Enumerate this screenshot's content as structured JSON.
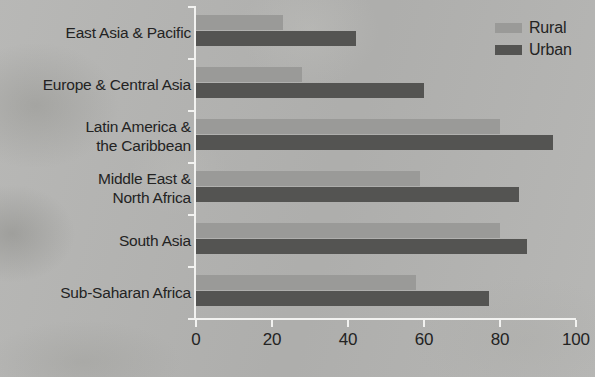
{
  "chart_data": {
    "type": "bar",
    "orientation": "horizontal",
    "title": "",
    "xlabel": "",
    "ylabel": "",
    "xlim": [
      0,
      100
    ],
    "xticks": [
      0,
      20,
      40,
      60,
      80,
      100
    ],
    "grid": false,
    "legend_position": "top-right",
    "categories": [
      "East Asia & Pacific",
      "Europe & Central Asia",
      "Latin America & the Caribbean",
      "Middle East & North Africa",
      "South Asia",
      "Sub-Saharan Africa"
    ],
    "category_lines": [
      [
        "East Asia & Pacific"
      ],
      [
        "Europe & Central Asia"
      ],
      [
        "Latin America &",
        "the Caribbean"
      ],
      [
        "Middle East &",
        "North Africa"
      ],
      [
        "South Asia"
      ],
      [
        "Sub-Saharan Africa"
      ]
    ],
    "series": [
      {
        "name": "Rural",
        "color": "#9a9a98",
        "values": [
          23,
          28,
          80,
          59,
          80,
          58
        ]
      },
      {
        "name": "Urban",
        "color": "#545452",
        "values": [
          42,
          60,
          94,
          85,
          87,
          77
        ]
      }
    ]
  },
  "legend": {
    "items": [
      {
        "label": "Rural",
        "color": "#9a9a98"
      },
      {
        "label": "Urban",
        "color": "#545452"
      }
    ]
  },
  "axis": {
    "tick_labels": [
      "0",
      "20",
      "40",
      "60",
      "80",
      "100"
    ],
    "line_color": "#f2f2f0",
    "text_color": "#232323"
  },
  "background": {
    "color": "#b4b4b2"
  }
}
